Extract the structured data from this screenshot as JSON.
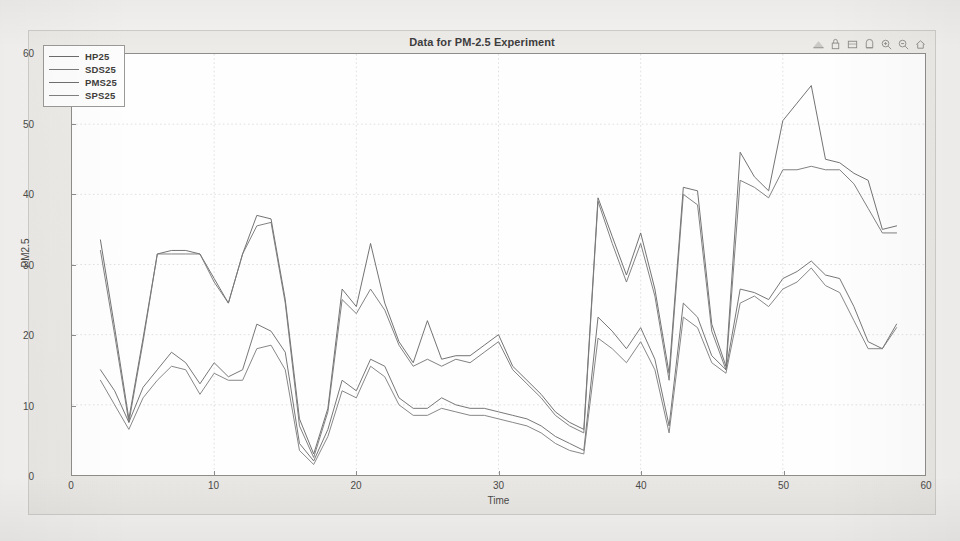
{
  "window": {
    "title": "Data for PM-2.5 Experiment"
  },
  "toolbar": {
    "buttons": [
      {
        "name": "rotate-3d-icon",
        "label": "Rotate 3D"
      },
      {
        "name": "data-cursor-icon",
        "label": "Data Cursor"
      },
      {
        "name": "insert-colorbar-icon",
        "label": "Insert Colorbar"
      },
      {
        "name": "insert-legend-icon",
        "label": "Insert Legend"
      },
      {
        "name": "zoom-in-icon",
        "label": "Zoom In"
      },
      {
        "name": "zoom-out-icon",
        "label": "Zoom Out"
      },
      {
        "name": "pan-home-icon",
        "label": "Restore View"
      }
    ]
  },
  "legend": {
    "entries": [
      "HP25",
      "SDS25",
      "PMS25",
      "SPS25"
    ]
  },
  "colors": {
    "hp25": "#6b6b6b",
    "sds25": "#7a7a7a",
    "pms25": "#6f6f6f",
    "sps25": "#808080",
    "axis": "#8e8d8a",
    "grid": "#d8d8d8",
    "text": "#4b4a47",
    "figure_bg": "#eceae7",
    "axes_bg": "#fefefe"
  },
  "chart_data": {
    "type": "line",
    "title": "Data for PM-2.5 Experiment",
    "xlabel": "Time",
    "ylabel": "PM2.5",
    "xlim": [
      0,
      60
    ],
    "ylim": [
      0,
      60
    ],
    "xticks": [
      0,
      10,
      20,
      30,
      40,
      50,
      60
    ],
    "yticks": [
      0,
      10,
      20,
      30,
      40,
      50,
      60
    ],
    "grid": true,
    "legend_position": "top-left",
    "x": [
      2,
      3,
      4,
      5,
      6,
      7,
      8,
      9,
      10,
      11,
      12,
      13,
      14,
      15,
      16,
      17,
      18,
      19,
      20,
      21,
      22,
      23,
      24,
      25,
      26,
      27,
      28,
      29,
      30,
      31,
      32,
      33,
      34,
      35,
      36,
      37,
      38,
      39,
      40,
      41,
      42,
      43,
      44,
      45,
      46,
      47,
      48,
      49,
      50,
      51,
      52,
      53,
      54,
      55,
      56,
      57,
      58
    ],
    "series": [
      {
        "name": "HP25",
        "values": [
          33.5,
          21.0,
          8.0,
          19.5,
          31.5,
          32.0,
          32.0,
          31.5,
          28.0,
          24.5,
          31.5,
          37.0,
          36.5,
          25.0,
          8.0,
          3.0,
          9.5,
          26.5,
          24.0,
          33.0,
          24.5,
          19.0,
          16.0,
          22.0,
          16.5,
          17.0,
          17.0,
          18.5,
          20.0,
          15.5,
          13.5,
          11.5,
          9.0,
          7.5,
          6.5,
          39.5,
          34.0,
          28.5,
          34.5,
          26.5,
          14.5,
          41.0,
          40.5,
          21.5,
          15.5,
          46.0,
          42.5,
          40.5,
          50.5,
          53.0,
          55.5,
          45.0,
          44.5,
          43.0,
          42.0,
          35.0,
          35.5
        ]
      },
      {
        "name": "SDS25",
        "values": [
          32.0,
          20.0,
          7.5,
          19.0,
          31.5,
          31.5,
          31.5,
          31.5,
          27.5,
          24.5,
          31.5,
          35.5,
          36.0,
          24.5,
          7.0,
          2.5,
          9.0,
          25.0,
          23.0,
          26.5,
          23.5,
          18.5,
          15.5,
          16.5,
          15.5,
          16.5,
          16.0,
          17.5,
          19.0,
          15.0,
          13.0,
          11.0,
          8.5,
          7.0,
          6.0,
          39.0,
          33.0,
          27.5,
          33.0,
          25.5,
          13.5,
          40.0,
          38.5,
          20.5,
          15.0,
          42.0,
          41.0,
          39.5,
          43.5,
          43.5,
          44.0,
          43.5,
          43.5,
          41.5,
          38.0,
          34.5,
          34.5
        ]
      },
      {
        "name": "PMS25",
        "values": [
          15.0,
          12.0,
          7.5,
          12.5,
          15.0,
          17.5,
          16.0,
          13.0,
          16.0,
          14.0,
          15.0,
          21.5,
          20.5,
          17.5,
          4.5,
          2.0,
          6.5,
          13.5,
          12.0,
          16.5,
          15.5,
          11.0,
          9.5,
          9.5,
          11.0,
          10.0,
          9.5,
          9.5,
          9.0,
          8.5,
          8.0,
          7.0,
          5.5,
          4.5,
          3.5,
          22.5,
          20.5,
          18.0,
          21.0,
          16.5,
          7.0,
          24.5,
          22.5,
          17.0,
          15.0,
          26.5,
          26.0,
          25.0,
          28.0,
          29.0,
          30.5,
          28.5,
          28.0,
          24.0,
          19.0,
          18.0,
          21.5
        ]
      },
      {
        "name": "SPS25",
        "values": [
          13.5,
          10.0,
          6.5,
          11.0,
          13.5,
          15.5,
          15.0,
          11.5,
          14.5,
          13.5,
          13.5,
          18.0,
          18.5,
          15.0,
          3.5,
          1.5,
          5.5,
          12.0,
          11.0,
          15.5,
          14.0,
          10.0,
          8.5,
          8.5,
          9.5,
          9.0,
          8.5,
          8.5,
          8.0,
          7.5,
          7.0,
          6.0,
          4.5,
          3.5,
          3.0,
          19.5,
          18.0,
          16.0,
          19.0,
          15.0,
          6.0,
          22.5,
          21.0,
          16.0,
          14.5,
          24.5,
          25.5,
          24.0,
          26.5,
          27.5,
          29.5,
          27.0,
          26.0,
          22.0,
          18.0,
          18.0,
          21.0
        ]
      }
    ]
  }
}
